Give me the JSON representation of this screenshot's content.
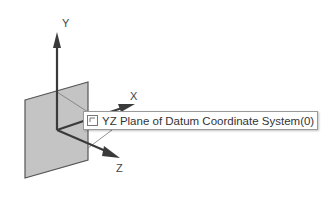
{
  "viewport": {
    "axes": {
      "y_label": "Y",
      "x_label": "X",
      "z_label": "Z"
    },
    "tooltip": {
      "icon": "plane-icon",
      "text": "YZ Plane of Datum Coordinate System(0)"
    }
  },
  "colors": {
    "plane_fill": "#c4c4c4",
    "plane_edge": "#555555",
    "axis": "#3a3a3a",
    "background": "#ffffff"
  }
}
